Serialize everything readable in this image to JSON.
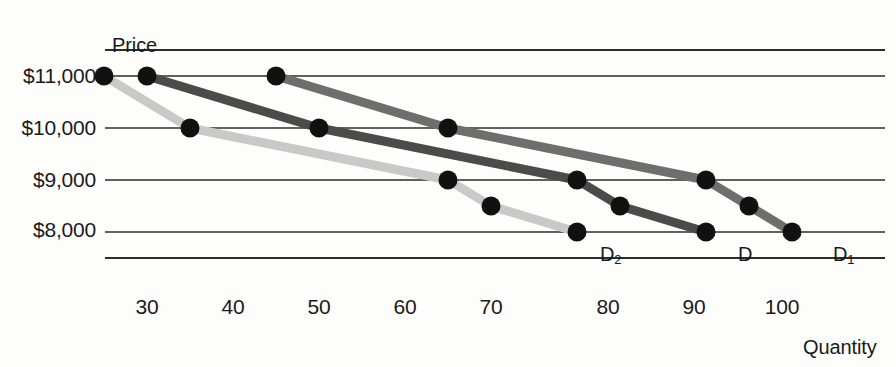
{
  "chart_data": {
    "type": "line",
    "title": "",
    "xlabel": "Quantity",
    "ylabel": "Price",
    "xlim": [
      25,
      110
    ],
    "ylim": [
      7500,
      11500
    ],
    "grid": "horizontal",
    "legend_position": "inline-endpoint-labels",
    "x_ticks": [
      30,
      40,
      50,
      60,
      70,
      80,
      90,
      100
    ],
    "x_tick_labels": [
      "30",
      "40",
      "50",
      "60",
      "70",
      "80",
      "90",
      "100"
    ],
    "y_ticks": [
      11000,
      10000,
      9000,
      8000
    ],
    "y_tick_labels": [
      "$11,000",
      "$10,000",
      "$9,000",
      "$8,000"
    ],
    "gridlines": [
      11500,
      11000,
      10000,
      9000,
      8000,
      7500
    ],
    "series": [
      {
        "name": "D2",
        "label": "D",
        "label_sub": "2",
        "color": "#c9c9c9",
        "marker_color": "#111111",
        "points": [
          {
            "x": 25,
            "y": 11000
          },
          {
            "x": 35,
            "y": 10000
          },
          {
            "x": 65,
            "y": 9000
          },
          {
            "x": 70,
            "y": 8500
          },
          {
            "x": 80,
            "y": 8000
          }
        ],
        "label_at": {
          "x": 80,
          "y": 8000
        }
      },
      {
        "name": "D",
        "label": "D",
        "label_sub": "",
        "color": "#4b4b4b",
        "marker_color": "#111111",
        "points": [
          {
            "x": 30,
            "y": 11000
          },
          {
            "x": 50,
            "y": 10000
          },
          {
            "x": 80,
            "y": 9000
          },
          {
            "x": 85,
            "y": 8500
          },
          {
            "x": 95,
            "y": 8000
          }
        ],
        "label_at": {
          "x": 95,
          "y": 8000
        }
      },
      {
        "name": "D1",
        "label": "D",
        "label_sub": "1",
        "color": "#6e6e6e",
        "marker_color": "#111111",
        "points": [
          {
            "x": 45,
            "y": 11000
          },
          {
            "x": 65,
            "y": 10000
          },
          {
            "x": 95,
            "y": 9000
          },
          {
            "x": 100,
            "y": 8500
          },
          {
            "x": 105,
            "y": 8000
          }
        ],
        "label_at": {
          "x": 105,
          "y": 8000
        }
      }
    ]
  },
  "axes": {
    "y_title": "Price",
    "x_title": "Quantity",
    "y_labels": [
      "$11,000",
      "$10,000",
      "$9,000",
      "$8,000"
    ],
    "x_labels": [
      "30",
      "40",
      "50",
      "60",
      "70",
      "80",
      "90",
      "100"
    ]
  },
  "curve_labels": [
    {
      "text": "D",
      "sub": "2"
    },
    {
      "text": "D",
      "sub": ""
    },
    {
      "text": "D",
      "sub": "1"
    }
  ],
  "colors": {
    "gridline": "#2b2b2b",
    "text": "#1a1a1a",
    "background": "#fdfdfc",
    "curve_d2": "#c9c9c9",
    "curve_d": "#4b4b4b",
    "curve_d1": "#6e6e6e",
    "marker": "#111111"
  }
}
